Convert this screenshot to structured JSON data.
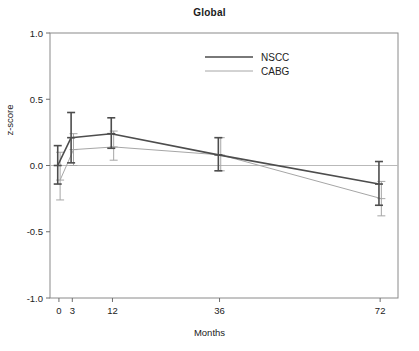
{
  "chart": {
    "title": "Global",
    "xlabel": "Months",
    "ylabel": "z-score"
  },
  "chart_data": {
    "type": "line",
    "title": "Global",
    "xlabel": "Months",
    "ylabel": "z-score",
    "x": [
      0,
      3,
      12,
      36,
      72
    ],
    "xtick_labels": [
      "0",
      "3",
      "12",
      "36",
      "72"
    ],
    "ytick_labels": [
      "1.0",
      "0.5",
      "0.0",
      "-0.5",
      "-1.0"
    ],
    "ytick_values": [
      1.0,
      0.5,
      0.0,
      -0.5,
      -1.0
    ],
    "xlim": [
      -2,
      76
    ],
    "ylim": [
      -1.0,
      1.0
    ],
    "grid": false,
    "zero_reference_line": 0.0,
    "legend_position": "top-center",
    "error_bars": "mean +/- 95% CI",
    "series": [
      {
        "name": "NSCC",
        "color": "#4d4d4d",
        "linewidth": 1.6,
        "values": [
          0.0,
          0.21,
          0.24,
          0.08,
          -0.14
        ],
        "err_low": [
          -0.14,
          0.02,
          0.13,
          -0.04,
          -0.3
        ],
        "err_high": [
          0.15,
          0.4,
          0.36,
          0.21,
          0.03
        ]
      },
      {
        "name": "CABG",
        "color": "#a6a6a6",
        "linewidth": 1.0,
        "values": [
          -0.11,
          0.12,
          0.14,
          0.08,
          -0.25
        ],
        "err_low": [
          -0.26,
          0.0,
          0.04,
          -0.04,
          -0.38
        ],
        "err_high": [
          0.1,
          0.24,
          0.26,
          0.21,
          -0.12
        ]
      }
    ]
  },
  "legend": {
    "items": [
      {
        "label": "NSCC",
        "color": "#4d4d4d"
      },
      {
        "label": "CABG",
        "color": "#a6a6a6"
      }
    ]
  }
}
